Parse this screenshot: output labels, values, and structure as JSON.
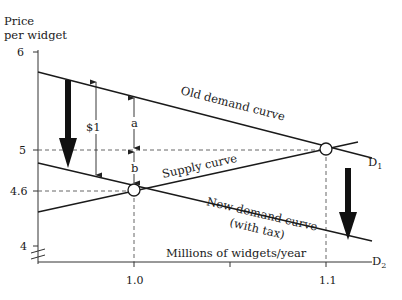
{
  "diagram": {
    "y_axis_label_line1": "Price",
    "y_axis_label_line2": "per widget",
    "x_axis_label": "Millions of widgets/year",
    "y_ticks": [
      "6",
      "5",
      "4.6",
      "4"
    ],
    "x_ticks": [
      "1.0",
      "1.1"
    ],
    "curves": {
      "old_demand": "Old demand curve",
      "supply": "Supply curve",
      "new_demand_line1": "New demand curve",
      "new_demand_line2": "(with tax)",
      "d1_label": "D",
      "d1_sub": "1",
      "d2_label": "D",
      "d2_sub": "2"
    },
    "annotations": {
      "tax": "$1",
      "a": "a",
      "b": "b"
    },
    "equilibria": [
      {
        "name": "old",
        "quantity": 1.1,
        "price": 5
      },
      {
        "name": "new",
        "quantity": 1.0,
        "price": 4.6
      }
    ]
  }
}
